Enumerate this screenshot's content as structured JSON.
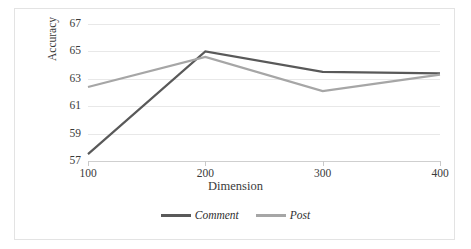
{
  "chart_data": {
    "type": "line",
    "title": "",
    "xlabel": "Dimension",
    "ylabel": "Accuracy",
    "categories": [
      "100",
      "200",
      "300",
      "400"
    ],
    "x": [
      100,
      200,
      300,
      400
    ],
    "xlim": [
      100,
      400
    ],
    "ylim": [
      57,
      67
    ],
    "yticks": [
      57,
      59,
      61,
      63,
      65,
      67
    ],
    "ytick_labels": [
      "57",
      "59",
      "61",
      "63",
      "65",
      "67"
    ],
    "xtick_labels": [
      "100",
      "200",
      "300",
      "400"
    ],
    "grid": "horizontal",
    "legend_position": "bottom-center",
    "series": [
      {
        "name": "Comment",
        "color": "#595959",
        "values": [
          57.5,
          65.0,
          63.5,
          63.4
        ]
      },
      {
        "name": "Post",
        "color": "#a6a6a6",
        "values": [
          62.4,
          64.6,
          62.1,
          63.3
        ]
      }
    ]
  },
  "legend": {
    "items": [
      {
        "label": "Comment",
        "color": "#595959"
      },
      {
        "label": "Post",
        "color": "#a6a6a6"
      }
    ]
  },
  "colors": {
    "comment": "#595959",
    "post": "#a6a6a6",
    "gridline": "#e8e8e8",
    "axis": "#cfcfcf",
    "border": "#e3e3e3",
    "text": "#3a3a3a"
  }
}
